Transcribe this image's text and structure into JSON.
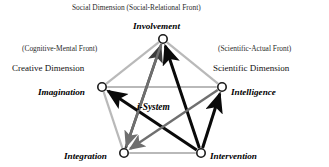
{
  "figure": {
    "title_note": "Social Dimension  (Social-Relational Front)",
    "center_label": "i-System"
  },
  "dimensions": [
    {
      "key": "social",
      "name": "Social Dimension",
      "front": "(Social-Relational Front)"
    },
    {
      "key": "creative",
      "name": "Creative Dimension",
      "front": "(Cognitive-Mental Front)"
    },
    {
      "key": "scientific",
      "name": "Scientific Dimension",
      "front": "(Scientific-Actual Front)"
    }
  ],
  "nodes": [
    {
      "id": "involvement",
      "label": "Involvement",
      "x": 163,
      "y": 39,
      "label_x": 133,
      "label_y": 22
    },
    {
      "id": "imagination",
      "label": "Imagination",
      "x": 102,
      "y": 87,
      "label_x": 38,
      "label_y": 88
    },
    {
      "id": "intelligence",
      "label": "Intelligence",
      "x": 222,
      "y": 87,
      "label_x": 231,
      "label_y": 88
    },
    {
      "id": "integration",
      "label": "Integration",
      "x": 124,
      "y": 153,
      "label_x": 64,
      "label_y": 152
    },
    {
      "id": "intervention",
      "label": "Intervention",
      "x": 201,
      "y": 153,
      "label_x": 210,
      "label_y": 152
    }
  ],
  "chart_data": {
    "type": "diagram",
    "perimeter_edges": [
      {
        "from": "involvement",
        "to": "imagination"
      },
      {
        "from": "involvement",
        "to": "intelligence"
      },
      {
        "from": "imagination",
        "to": "intelligence"
      },
      {
        "from": "imagination",
        "to": "integration"
      },
      {
        "from": "intelligence",
        "to": "intervention"
      },
      {
        "from": "integration",
        "to": "intervention"
      }
    ],
    "directed_edges": [
      {
        "from": "intervention",
        "to": "involvement",
        "tone": "black"
      },
      {
        "from": "integration",
        "to": "involvement",
        "tone": "dark"
      },
      {
        "from": "intervention",
        "to": "imagination",
        "tone": "black"
      },
      {
        "from": "intervention",
        "to": "intelligence",
        "tone": "black"
      },
      {
        "from": "involvement",
        "to": "integration",
        "tone": "gray"
      },
      {
        "from": "intelligence",
        "to": "integration",
        "tone": "gray"
      }
    ],
    "colors": {
      "perimeter": "#b9b9b9",
      "black": "#0a0a0a",
      "dark": "#3c3c3c",
      "gray": "#6f6f6f",
      "node_stroke": "#1a1a1a",
      "node_fill": "#ffffff",
      "background": "#ffffff"
    }
  },
  "legend": {
    "social_front": "(Social-Relational Front)",
    "cognitive_front": "(Cognitive-Mental Front)",
    "scientific_front": "(Scientific-Actual Front)"
  }
}
